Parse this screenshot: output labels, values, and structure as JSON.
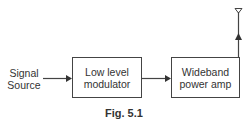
{
  "diagram": {
    "input": {
      "line1": "Signal",
      "line2": "Source"
    },
    "blocks": [
      {
        "line1": "Low level",
        "line2": "modulator"
      },
      {
        "line1": "Wideband",
        "line2": "power amp"
      }
    ],
    "caption": "Fig. 5.1",
    "colors": {
      "stroke": "#444444",
      "text": "#333333"
    }
  }
}
